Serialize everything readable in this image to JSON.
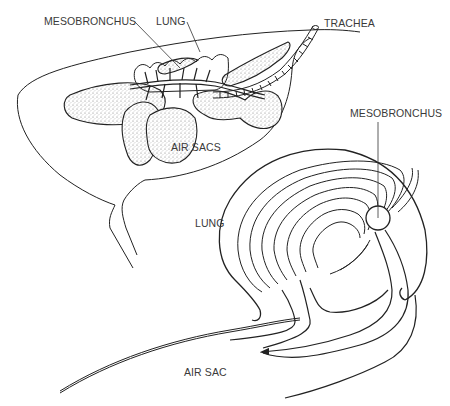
{
  "diagram": {
    "style": "black ink line drawing on white",
    "colors": {
      "ink": "#222222",
      "label": "#3a3a3a",
      "background": "#ffffff",
      "stipple": "#888888"
    },
    "top_figure": {
      "labels": {
        "mesobronchus": "MESOBRONCHUS",
        "lung": "LUNG",
        "trachea": "TRACHEA",
        "air_sacs": "AIR SACS"
      }
    },
    "bottom_figure": {
      "labels": {
        "mesobronchus": "MESOBRONCHUS",
        "lung": "LUNG",
        "air_sac": "AIR SAC"
      }
    }
  }
}
